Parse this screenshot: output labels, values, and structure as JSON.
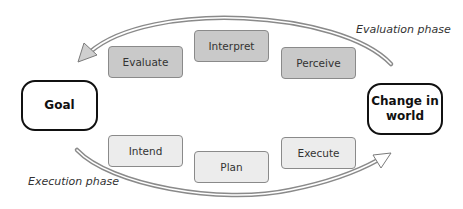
{
  "diagram": {
    "nodes": {
      "goal": "Goal",
      "change_line1": "Change in",
      "change_line2": "world"
    },
    "evaluation_stages": [
      "Evaluate",
      "Interpret",
      "Perceive"
    ],
    "execution_stages": [
      "Intend",
      "Plan",
      "Execute"
    ],
    "phases": {
      "evaluation": "Evaluation phase",
      "execution": "Execution phase"
    },
    "edges": [
      {
        "from": "Change in world",
        "to": "Goal",
        "label": "Evaluation phase",
        "style": "curved double-line arrow, top"
      },
      {
        "from": "Goal",
        "to": "Change in world",
        "label": "Execution phase",
        "style": "curved double-line arrow, bottom"
      }
    ],
    "colors": {
      "evaluation_box_fill": "#c9c9c9",
      "execution_box_fill": "#ececec",
      "box_border": "#8a8a8a",
      "node_border": "#111111",
      "arrow": "#8a8a8a"
    }
  }
}
